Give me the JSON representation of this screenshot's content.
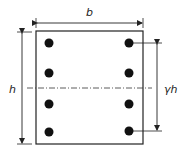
{
  "diagram": {
    "labels": {
      "width": "b",
      "height": "h",
      "bar_spacing": "γh"
    },
    "reinforcement": {
      "bars_per_side": 4,
      "sides": 2,
      "total_bars": 8
    },
    "colors": {
      "stroke": "#222222",
      "bar_fill": "#111111",
      "background": "#ffffff"
    }
  }
}
